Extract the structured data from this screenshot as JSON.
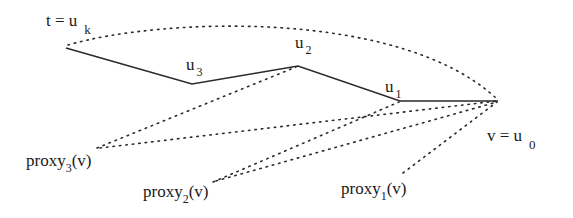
{
  "diagram": {
    "type": "path-with-proxies",
    "colors": {
      "line": "#2a2a2a",
      "text": "#1a1a1a",
      "background": "#ffffff"
    },
    "nodes": [
      {
        "id": "uk",
        "label_main": "t = u",
        "label_sub": "k",
        "x": 66,
        "y": 48
      },
      {
        "id": "u3",
        "label_main": "u",
        "label_sub": "3",
        "x": 192,
        "y": 84
      },
      {
        "id": "u2",
        "label_main": "u",
        "label_sub": "2",
        "x": 298,
        "y": 66
      },
      {
        "id": "u1",
        "label_main": "u",
        "label_sub": "1",
        "x": 400,
        "y": 101
      },
      {
        "id": "u0",
        "label_main": "v = u",
        "label_sub": "0",
        "x": 498,
        "y": 101
      }
    ],
    "proxies": [
      {
        "id": "proxy3",
        "label_main": "proxy",
        "label_sub": "3",
        "label_tail": "(v)"
      },
      {
        "id": "proxy2",
        "label_main": "proxy",
        "label_sub": "2",
        "label_tail": "(v)"
      },
      {
        "id": "proxy1",
        "label_main": "proxy",
        "label_sub": "1",
        "label_tail": "(v)"
      }
    ],
    "edges": {
      "solid_path": [
        "uk",
        "u3",
        "u2",
        "u1",
        "u0"
      ],
      "dotted": [
        [
          "uk",
          "u0"
        ],
        [
          "proxy3",
          "u2"
        ],
        [
          "proxy3",
          "u0"
        ],
        [
          "proxy2",
          "u1"
        ],
        [
          "proxy2",
          "u0"
        ],
        [
          "proxy1",
          "u0"
        ]
      ]
    }
  }
}
